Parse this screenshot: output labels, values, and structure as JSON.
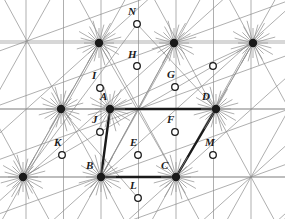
{
  "figure": {
    "width": 285,
    "height": 219,
    "background_color": "#ffffff",
    "lattice_line_color": "#8c8c8c",
    "bold_line_color": "#1a1a1a",
    "filled_node_color": "#1a1a1a",
    "hollow_node_fill": "#ffffff",
    "hollow_node_stroke": "#1a1a1a",
    "lattice_line_width": 0.7,
    "bold_line_width": 2.4
  },
  "chart_data": {
    "type": "scatter",
    "xlabel": "",
    "ylabel": "",
    "xlim": [
      0,
      285
    ],
    "ylim": [
      219,
      0
    ],
    "grid": true,
    "legend": "none",
    "lattice_vectors": {
      "a1": [
        75,
        0
      ],
      "a2": [
        38,
        -68
      ]
    },
    "node_types": {
      "filled": "primary lattice point (large black disc with radiating spokes)",
      "hollow": "secondary lattice point (small open circle)"
    },
    "filled_nodes": [
      {
        "id": "P1",
        "label": "",
        "x": 99,
        "y": 43
      },
      {
        "id": "P2",
        "label": "",
        "x": 174,
        "y": 43
      },
      {
        "id": "P3",
        "label": "",
        "x": 253,
        "y": 43
      },
      {
        "id": "P4",
        "label": "",
        "x": 61,
        "y": 109
      },
      {
        "id": "A",
        "label": "A",
        "x": 110,
        "y": 109
      },
      {
        "id": "D",
        "label": "D",
        "x": 216,
        "y": 109
      },
      {
        "id": "P5",
        "label": "",
        "x": 23,
        "y": 177
      },
      {
        "id": "B",
        "label": "B",
        "x": 101,
        "y": 177
      },
      {
        "id": "C",
        "label": "C",
        "x": 176,
        "y": 177
      }
    ],
    "hollow_nodes": [
      {
        "id": "N",
        "label": "N",
        "x": 137,
        "y": 24
      },
      {
        "id": "H",
        "label": "H",
        "x": 137,
        "y": 66
      },
      {
        "id": "Q1",
        "label": "",
        "x": 213,
        "y": 66
      },
      {
        "id": "I",
        "label": "I",
        "x": 100,
        "y": 88
      },
      {
        "id": "G",
        "label": "G",
        "x": 175,
        "y": 87
      },
      {
        "id": "J",
        "label": "J",
        "x": 100,
        "y": 132
      },
      {
        "id": "F",
        "label": "F",
        "x": 175,
        "y": 132
      },
      {
        "id": "K",
        "label": "K",
        "x": 62,
        "y": 155
      },
      {
        "id": "E",
        "label": "E",
        "x": 138,
        "y": 155
      },
      {
        "id": "M",
        "label": "M",
        "x": 213,
        "y": 155
      },
      {
        "id": "L",
        "label": "L",
        "x": 138,
        "y": 198
      }
    ],
    "bold_polygon": {
      "name": "parallelogram-ABCD",
      "vertices": [
        "A",
        "B",
        "C",
        "D"
      ],
      "points": [
        [
          110,
          109
        ],
        [
          101,
          177
        ],
        [
          176,
          177
        ],
        [
          216,
          109
        ]
      ],
      "closed": true
    }
  },
  "labels": [
    {
      "name": "label-N",
      "text": "N",
      "x": 128,
      "y": 6
    },
    {
      "name": "label-H",
      "text": "H",
      "x": 128,
      "y": 49
    },
    {
      "name": "label-I",
      "text": "I",
      "x": 92,
      "y": 70
    },
    {
      "name": "label-G",
      "text": "G",
      "x": 167,
      "y": 69
    },
    {
      "name": "label-A",
      "text": "A",
      "x": 100,
      "y": 91
    },
    {
      "name": "label-D",
      "text": "D",
      "x": 202,
      "y": 91
    },
    {
      "name": "label-J",
      "text": "J",
      "x": 92,
      "y": 114
    },
    {
      "name": "label-F",
      "text": "F",
      "x": 167,
      "y": 114
    },
    {
      "name": "label-K",
      "text": "K",
      "x": 54,
      "y": 137
    },
    {
      "name": "label-E",
      "text": "E",
      "x": 130,
      "y": 137
    },
    {
      "name": "label-M",
      "text": "M",
      "x": 205,
      "y": 137
    },
    {
      "name": "label-B",
      "text": "B",
      "x": 86,
      "y": 160
    },
    {
      "name": "label-C",
      "text": "C",
      "x": 161,
      "y": 160
    },
    {
      "name": "label-L",
      "text": "L",
      "x": 130,
      "y": 180
    }
  ]
}
